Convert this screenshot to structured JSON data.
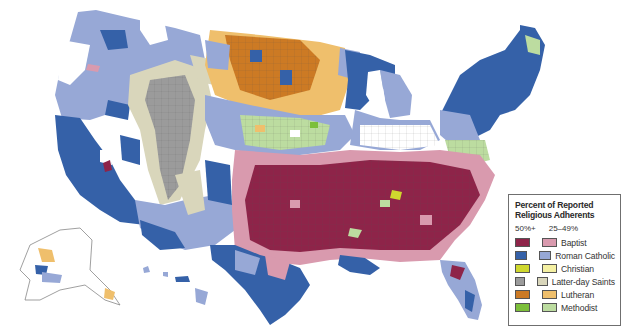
{
  "map": {
    "title": "Percent of Reported Religious Adherents",
    "region": "United States counties",
    "insets": [
      "Alaska",
      "Hawaii"
    ]
  },
  "legend": {
    "title": "Percent of Reported Religious Adherents",
    "column_headers": {
      "high": "50%+",
      "low": "25–49%"
    },
    "items": [
      {
        "label": "Baptist",
        "color_high": "#8e2449",
        "color_low": "#d99aae"
      },
      {
        "label": "Roman Catholic",
        "color_high": "#3561a8",
        "color_low": "#97a8d6"
      },
      {
        "label": "Christian",
        "color_high": "#cfd82e",
        "color_low": "#f4f0a2"
      },
      {
        "label": "Latter-day Saints",
        "color_high": "#9b9b9b",
        "color_low": "#d9d6bb"
      },
      {
        "label": "Lutheran",
        "color_high": "#cc7a24",
        "color_low": "#efbf6c"
      },
      {
        "label": "Methodist",
        "color_high": "#7cbf3a",
        "color_low": "#bcdca0"
      }
    ]
  }
}
